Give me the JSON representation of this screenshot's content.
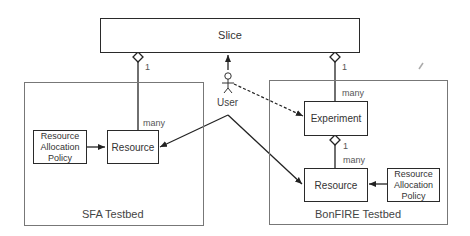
{
  "diagram": {
    "slice": {
      "label": "Slice"
    },
    "user": {
      "label": "User"
    },
    "sfa_testbed": {
      "label": "SFA Testbed",
      "resource": {
        "label": "Resource"
      },
      "policy": {
        "label_lines": [
          "Resource",
          "Allocation",
          "Policy"
        ]
      },
      "multiplicity_top": "1",
      "multiplicity_bottom": "many"
    },
    "bonfire_testbed": {
      "label": "BonFIRE Testbed",
      "experiment": {
        "label": "Experiment"
      },
      "resource": {
        "label": "Resource"
      },
      "policy": {
        "label_lines": [
          "Resource",
          "Allocation",
          "Policy"
        ]
      },
      "slice_multiplicity_top": "1",
      "slice_multiplicity_bottom": "many",
      "exp_multiplicity_top": "1",
      "exp_multiplicity_bottom": "many"
    },
    "icons": [
      "stick-figure-icon",
      "pencil-icon"
    ]
  }
}
